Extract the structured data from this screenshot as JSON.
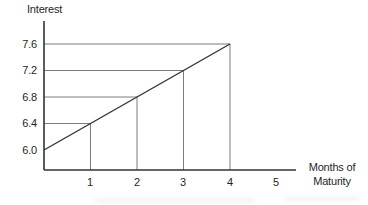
{
  "figure": {
    "y_axis_title": "Interest",
    "x_axis_title_lines": [
      "Months of",
      "Maturity"
    ],
    "y_ticks": [
      "7.6",
      "7.2",
      "6.8",
      "6.4",
      "6.0"
    ],
    "x_ticks": [
      "1",
      "2",
      "3",
      "4",
      "5"
    ]
  },
  "chart_data": {
    "type": "line",
    "x": [
      0,
      1,
      2,
      3,
      4
    ],
    "values": [
      6.0,
      6.4,
      6.8,
      7.2,
      7.6
    ],
    "title": "",
    "xlabel": "Months of Maturity",
    "ylabel": "Interest",
    "x_tick_values": [
      1,
      2,
      3,
      4,
      5
    ],
    "y_tick_values": [
      6.0,
      6.4,
      6.8,
      7.2,
      7.6
    ],
    "xlim": [
      0,
      5.45
    ],
    "ylim": [
      5.7,
      7.95
    ],
    "grid": "off",
    "guide_lines": "each data point connected to both axes by thin gray lines",
    "legend": "none",
    "markers": "none"
  },
  "colors": {
    "background": "#ffffff",
    "axis": "#333333",
    "series_line": "#333333",
    "guide_line": "#7c7c7c",
    "text": "#1f1f1f"
  }
}
